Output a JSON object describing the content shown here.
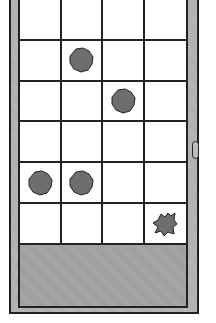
{
  "game": {
    "board": {
      "columns": 4,
      "rows": 6
    },
    "pieces": [
      {
        "row": 1,
        "col": 1,
        "type": "rock-blob"
      },
      {
        "row": 2,
        "col": 2,
        "type": "rock-blob"
      },
      {
        "row": 4,
        "col": 0,
        "type": "rock-blob"
      },
      {
        "row": 4,
        "col": 1,
        "type": "rock-blob"
      },
      {
        "row": 5,
        "col": 3,
        "type": "spiky-blob"
      }
    ],
    "colors": {
      "frame": "#b8b8b8",
      "piece": "#6e6e6e",
      "outline": "#222222",
      "tray": "#a9a9a9"
    }
  }
}
